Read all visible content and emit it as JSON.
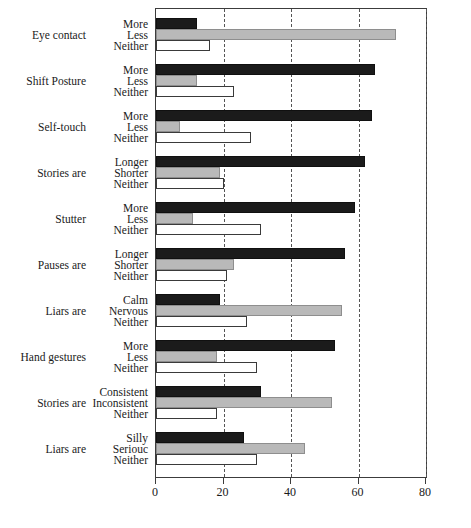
{
  "chart_data": {
    "type": "bar",
    "orientation": "horizontal",
    "title": "",
    "subtitle": "",
    "xlabel": "",
    "ylabel": "",
    "xlim": [
      0,
      80
    ],
    "xticks": [
      0,
      20,
      40,
      60,
      80
    ],
    "xtick_labels": [
      "0",
      "20",
      "40",
      "60",
      "80"
    ],
    "grid": "vertical-dashed",
    "legend": "none",
    "series": [
      {
        "name": "first-option",
        "style": "black"
      },
      {
        "name": "second-option",
        "style": "gray"
      },
      {
        "name": "neither",
        "style": "white"
      }
    ],
    "groups": [
      {
        "category": "Eye contact",
        "options": [
          "More",
          "Less",
          "Neither"
        ],
        "values": [
          12,
          71,
          16
        ]
      },
      {
        "category": "Shift Posture",
        "options": [
          "More",
          "Less",
          "Neither"
        ],
        "values": [
          65,
          12,
          23
        ]
      },
      {
        "category": "Self-touch",
        "options": [
          "More",
          "Less",
          "Neither"
        ],
        "values": [
          64,
          7,
          28
        ]
      },
      {
        "category": "Stories are",
        "options": [
          "Longer",
          "Shorter",
          "Neither"
        ],
        "values": [
          62,
          19,
          20
        ]
      },
      {
        "category": "Stutter",
        "options": [
          "More",
          "Less",
          "Neither"
        ],
        "values": [
          59,
          11,
          31
        ]
      },
      {
        "category": "Pauses are",
        "options": [
          "Longer",
          "Shorter",
          "Neither"
        ],
        "values": [
          56,
          23,
          21
        ]
      },
      {
        "category": "Liars are",
        "options": [
          "Calm",
          "Nervous",
          "Neither"
        ],
        "values": [
          19,
          55,
          27
        ]
      },
      {
        "category": "Hand gestures",
        "options": [
          "More",
          "Less",
          "Neither"
        ],
        "values": [
          53,
          18,
          30
        ]
      },
      {
        "category": "Stories are",
        "options": [
          "Consistent",
          "Inconsistent",
          "Neither"
        ],
        "values": [
          31,
          52,
          18
        ]
      },
      {
        "category": "Liars are",
        "options": [
          "Silly",
          "Seriouc",
          "Neither"
        ],
        "values": [
          26,
          44,
          30
        ]
      }
    ]
  },
  "colors": {
    "series_black": "#1b1b1b",
    "series_gray": "#b9b9b9",
    "series_white": "#ffffff",
    "axis": "#3c3c3c",
    "gridline": "#555555",
    "background": "#ffffff"
  }
}
